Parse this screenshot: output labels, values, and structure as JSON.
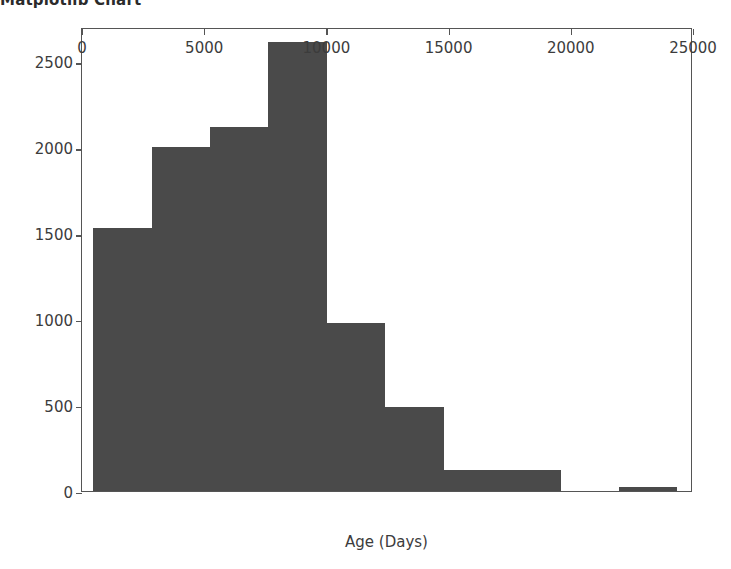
{
  "figure": {
    "title": "Matplotlib Chart",
    "background_color": "#ffffff",
    "bar_color": "#4a4a4a",
    "axis_color": "#555555",
    "text_color": "#3c3c3c"
  },
  "chart_data": {
    "type": "bar",
    "title": "Matplotlib Chart",
    "subtitle": "",
    "xlabel": "Age (Days)",
    "ylabel": "",
    "xlim": [
      0,
      25000
    ],
    "ylim": [
      0,
      2700
    ],
    "grid": false,
    "legend": null,
    "xticks": [
      0,
      5000,
      10000,
      15000,
      20000,
      25000
    ],
    "xtick_labels": [
      "0",
      "5000",
      "10000",
      "15000",
      "20000",
      "25000"
    ],
    "yticks": [
      0,
      500,
      1000,
      1500,
      2000,
      2500
    ],
    "ytick_labels": [
      "0",
      "500",
      "1000",
      "1500",
      "2000",
      "2500"
    ],
    "bin_edges": [
      460,
      2850,
      5240,
      7630,
      10020,
      12410,
      14800,
      17190,
      19580,
      21970,
      24360
    ],
    "categories": [
      "460-2850",
      "2850-5240",
      "5240-7630",
      "7630-10020",
      "10020-12410",
      "12410-14800",
      "14800-17190",
      "17190-19580",
      "19580-21970",
      "21970-24360"
    ],
    "values": [
      1530,
      2000,
      2120,
      2610,
      980,
      490,
      125,
      125,
      0,
      25
    ]
  }
}
